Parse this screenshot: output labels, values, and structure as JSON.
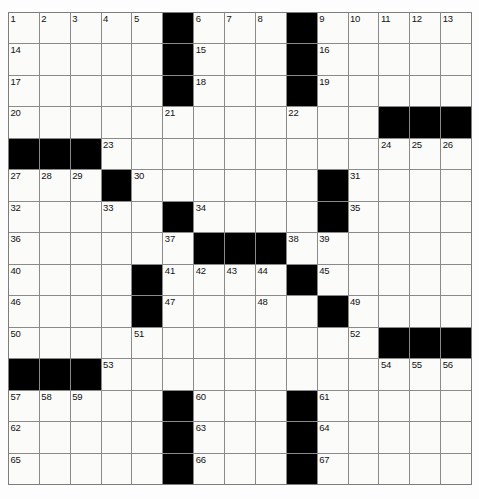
{
  "puzzle": {
    "type": "crossword-grid",
    "rows": 15,
    "cols": 15,
    "colors": {
      "block": "#000000",
      "cell": "#fbfbfa",
      "grid_line": "#8a8a8a",
      "number_text": "#111111",
      "page_background": "#ffffff"
    },
    "grid": [
      {
        "row": 1,
        "cells": [
          {
            "type": "open",
            "number": "1"
          },
          {
            "type": "open",
            "number": "2"
          },
          {
            "type": "open",
            "number": "3"
          },
          {
            "type": "open",
            "number": "4"
          },
          {
            "type": "open",
            "number": "5"
          },
          {
            "type": "block",
            "number": ""
          },
          {
            "type": "open",
            "number": "6"
          },
          {
            "type": "open",
            "number": "7"
          },
          {
            "type": "open",
            "number": "8"
          },
          {
            "type": "block",
            "number": ""
          },
          {
            "type": "open",
            "number": "9"
          },
          {
            "type": "open",
            "number": "10"
          },
          {
            "type": "open",
            "number": "11"
          },
          {
            "type": "open",
            "number": "12"
          },
          {
            "type": "open",
            "number": "13"
          }
        ]
      },
      {
        "row": 2,
        "cells": [
          {
            "type": "open",
            "number": "14"
          },
          {
            "type": "open",
            "number": ""
          },
          {
            "type": "open",
            "number": ""
          },
          {
            "type": "open",
            "number": ""
          },
          {
            "type": "open",
            "number": ""
          },
          {
            "type": "block",
            "number": ""
          },
          {
            "type": "open",
            "number": "15"
          },
          {
            "type": "open",
            "number": ""
          },
          {
            "type": "open",
            "number": ""
          },
          {
            "type": "block",
            "number": ""
          },
          {
            "type": "open",
            "number": "16"
          },
          {
            "type": "open",
            "number": ""
          },
          {
            "type": "open",
            "number": ""
          },
          {
            "type": "open",
            "number": ""
          },
          {
            "type": "open",
            "number": ""
          }
        ]
      },
      {
        "row": 3,
        "cells": [
          {
            "type": "open",
            "number": "17"
          },
          {
            "type": "open",
            "number": ""
          },
          {
            "type": "open",
            "number": ""
          },
          {
            "type": "open",
            "number": ""
          },
          {
            "type": "open",
            "number": ""
          },
          {
            "type": "block",
            "number": ""
          },
          {
            "type": "open",
            "number": "18"
          },
          {
            "type": "open",
            "number": ""
          },
          {
            "type": "open",
            "number": ""
          },
          {
            "type": "block",
            "number": ""
          },
          {
            "type": "open",
            "number": "19"
          },
          {
            "type": "open",
            "number": ""
          },
          {
            "type": "open",
            "number": ""
          },
          {
            "type": "open",
            "number": ""
          },
          {
            "type": "open",
            "number": ""
          }
        ]
      },
      {
        "row": 4,
        "cells": [
          {
            "type": "open",
            "number": "20"
          },
          {
            "type": "open",
            "number": ""
          },
          {
            "type": "open",
            "number": ""
          },
          {
            "type": "open",
            "number": ""
          },
          {
            "type": "open",
            "number": ""
          },
          {
            "type": "open",
            "number": "21"
          },
          {
            "type": "open",
            "number": ""
          },
          {
            "type": "open",
            "number": ""
          },
          {
            "type": "open",
            "number": ""
          },
          {
            "type": "open",
            "number": "22"
          },
          {
            "type": "open",
            "number": ""
          },
          {
            "type": "open",
            "number": ""
          },
          {
            "type": "block",
            "number": ""
          },
          {
            "type": "block",
            "number": ""
          },
          {
            "type": "block",
            "number": ""
          }
        ]
      },
      {
        "row": 5,
        "cells": [
          {
            "type": "block",
            "number": ""
          },
          {
            "type": "block",
            "number": ""
          },
          {
            "type": "block",
            "number": ""
          },
          {
            "type": "open",
            "number": "23"
          },
          {
            "type": "open",
            "number": ""
          },
          {
            "type": "open",
            "number": ""
          },
          {
            "type": "open",
            "number": ""
          },
          {
            "type": "open",
            "number": ""
          },
          {
            "type": "open",
            "number": ""
          },
          {
            "type": "open",
            "number": ""
          },
          {
            "type": "open",
            "number": ""
          },
          {
            "type": "open",
            "number": ""
          },
          {
            "type": "open",
            "number": "24"
          },
          {
            "type": "open",
            "number": "25"
          },
          {
            "type": "open",
            "number": "26"
          }
        ]
      },
      {
        "row": 6,
        "cells": [
          {
            "type": "open",
            "number": "27"
          },
          {
            "type": "open",
            "number": "28"
          },
          {
            "type": "open",
            "number": "29"
          },
          {
            "type": "block",
            "number": ""
          },
          {
            "type": "open",
            "number": "30"
          },
          {
            "type": "open",
            "number": ""
          },
          {
            "type": "open",
            "number": ""
          },
          {
            "type": "open",
            "number": ""
          },
          {
            "type": "open",
            "number": ""
          },
          {
            "type": "open",
            "number": ""
          },
          {
            "type": "block",
            "number": ""
          },
          {
            "type": "open",
            "number": "31"
          },
          {
            "type": "open",
            "number": ""
          },
          {
            "type": "open",
            "number": ""
          },
          {
            "type": "open",
            "number": ""
          }
        ]
      },
      {
        "row": 7,
        "cells": [
          {
            "type": "open",
            "number": "32"
          },
          {
            "type": "open",
            "number": ""
          },
          {
            "type": "open",
            "number": ""
          },
          {
            "type": "open",
            "number": "33"
          },
          {
            "type": "open",
            "number": ""
          },
          {
            "type": "block",
            "number": ""
          },
          {
            "type": "open",
            "number": "34"
          },
          {
            "type": "open",
            "number": ""
          },
          {
            "type": "open",
            "number": ""
          },
          {
            "type": "open",
            "number": ""
          },
          {
            "type": "block",
            "number": ""
          },
          {
            "type": "open",
            "number": "35"
          },
          {
            "type": "open",
            "number": ""
          },
          {
            "type": "open",
            "number": ""
          },
          {
            "type": "open",
            "number": ""
          }
        ]
      },
      {
        "row": 8,
        "cells": [
          {
            "type": "open",
            "number": "36"
          },
          {
            "type": "open",
            "number": ""
          },
          {
            "type": "open",
            "number": ""
          },
          {
            "type": "open",
            "number": ""
          },
          {
            "type": "open",
            "number": ""
          },
          {
            "type": "open",
            "number": "37"
          },
          {
            "type": "block",
            "number": ""
          },
          {
            "type": "block",
            "number": ""
          },
          {
            "type": "block",
            "number": ""
          },
          {
            "type": "open",
            "number": "38"
          },
          {
            "type": "open",
            "number": "39"
          },
          {
            "type": "open",
            "number": ""
          },
          {
            "type": "open",
            "number": ""
          },
          {
            "type": "open",
            "number": ""
          },
          {
            "type": "open",
            "number": ""
          }
        ]
      },
      {
        "row": 9,
        "cells": [
          {
            "type": "open",
            "number": "40"
          },
          {
            "type": "open",
            "number": ""
          },
          {
            "type": "open",
            "number": ""
          },
          {
            "type": "open",
            "number": ""
          },
          {
            "type": "block",
            "number": ""
          },
          {
            "type": "open",
            "number": "41"
          },
          {
            "type": "open",
            "number": "42"
          },
          {
            "type": "open",
            "number": "43"
          },
          {
            "type": "open",
            "number": "44"
          },
          {
            "type": "block",
            "number": ""
          },
          {
            "type": "open",
            "number": "45"
          },
          {
            "type": "open",
            "number": ""
          },
          {
            "type": "open",
            "number": ""
          },
          {
            "type": "open",
            "number": ""
          },
          {
            "type": "open",
            "number": ""
          }
        ]
      },
      {
        "row": 10,
        "cells": [
          {
            "type": "open",
            "number": "46"
          },
          {
            "type": "open",
            "number": ""
          },
          {
            "type": "open",
            "number": ""
          },
          {
            "type": "open",
            "number": ""
          },
          {
            "type": "block",
            "number": ""
          },
          {
            "type": "open",
            "number": "47"
          },
          {
            "type": "open",
            "number": ""
          },
          {
            "type": "open",
            "number": ""
          },
          {
            "type": "open",
            "number": "48"
          },
          {
            "type": "open",
            "number": ""
          },
          {
            "type": "block",
            "number": ""
          },
          {
            "type": "open",
            "number": "49"
          },
          {
            "type": "open",
            "number": ""
          },
          {
            "type": "open",
            "number": ""
          },
          {
            "type": "open",
            "number": ""
          }
        ]
      },
      {
        "row": 11,
        "cells": [
          {
            "type": "open",
            "number": "50"
          },
          {
            "type": "open",
            "number": ""
          },
          {
            "type": "open",
            "number": ""
          },
          {
            "type": "open",
            "number": ""
          },
          {
            "type": "open",
            "number": "51"
          },
          {
            "type": "open",
            "number": ""
          },
          {
            "type": "open",
            "number": ""
          },
          {
            "type": "open",
            "number": ""
          },
          {
            "type": "open",
            "number": ""
          },
          {
            "type": "open",
            "number": ""
          },
          {
            "type": "open",
            "number": ""
          },
          {
            "type": "open",
            "number": "52"
          },
          {
            "type": "block",
            "number": ""
          },
          {
            "type": "block",
            "number": ""
          },
          {
            "type": "block",
            "number": ""
          }
        ]
      },
      {
        "row": 12,
        "cells": [
          {
            "type": "block",
            "number": ""
          },
          {
            "type": "block",
            "number": ""
          },
          {
            "type": "block",
            "number": ""
          },
          {
            "type": "open",
            "number": "53"
          },
          {
            "type": "open",
            "number": ""
          },
          {
            "type": "open",
            "number": ""
          },
          {
            "type": "open",
            "number": ""
          },
          {
            "type": "open",
            "number": ""
          },
          {
            "type": "open",
            "number": ""
          },
          {
            "type": "open",
            "number": ""
          },
          {
            "type": "open",
            "number": ""
          },
          {
            "type": "open",
            "number": ""
          },
          {
            "type": "open",
            "number": "54"
          },
          {
            "type": "open",
            "number": "55"
          },
          {
            "type": "open",
            "number": "56"
          }
        ]
      },
      {
        "row": 13,
        "cells": [
          {
            "type": "open",
            "number": "57"
          },
          {
            "type": "open",
            "number": "58"
          },
          {
            "type": "open",
            "number": "59"
          },
          {
            "type": "open",
            "number": ""
          },
          {
            "type": "open",
            "number": ""
          },
          {
            "type": "block",
            "number": ""
          },
          {
            "type": "open",
            "number": "60"
          },
          {
            "type": "open",
            "number": ""
          },
          {
            "type": "open",
            "number": ""
          },
          {
            "type": "block",
            "number": ""
          },
          {
            "type": "open",
            "number": "61"
          },
          {
            "type": "open",
            "number": ""
          },
          {
            "type": "open",
            "number": ""
          },
          {
            "type": "open",
            "number": ""
          },
          {
            "type": "open",
            "number": ""
          }
        ]
      },
      {
        "row": 14,
        "cells": [
          {
            "type": "open",
            "number": "62"
          },
          {
            "type": "open",
            "number": ""
          },
          {
            "type": "open",
            "number": ""
          },
          {
            "type": "open",
            "number": ""
          },
          {
            "type": "open",
            "number": ""
          },
          {
            "type": "block",
            "number": ""
          },
          {
            "type": "open",
            "number": "63"
          },
          {
            "type": "open",
            "number": ""
          },
          {
            "type": "open",
            "number": ""
          },
          {
            "type": "block",
            "number": ""
          },
          {
            "type": "open",
            "number": "64"
          },
          {
            "type": "open",
            "number": ""
          },
          {
            "type": "open",
            "number": ""
          },
          {
            "type": "open",
            "number": ""
          },
          {
            "type": "open",
            "number": ""
          }
        ]
      },
      {
        "row": 15,
        "cells": [
          {
            "type": "open",
            "number": "65"
          },
          {
            "type": "open",
            "number": ""
          },
          {
            "type": "open",
            "number": ""
          },
          {
            "type": "open",
            "number": ""
          },
          {
            "type": "open",
            "number": ""
          },
          {
            "type": "block",
            "number": ""
          },
          {
            "type": "open",
            "number": "66"
          },
          {
            "type": "open",
            "number": ""
          },
          {
            "type": "open",
            "number": ""
          },
          {
            "type": "block",
            "number": ""
          },
          {
            "type": "open",
            "number": "67"
          },
          {
            "type": "open",
            "number": ""
          },
          {
            "type": "open",
            "number": ""
          },
          {
            "type": "open",
            "number": ""
          },
          {
            "type": "open",
            "number": ""
          }
        ]
      }
    ]
  }
}
